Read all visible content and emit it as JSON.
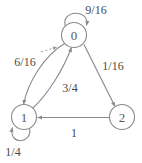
{
  "diagram": {
    "type": "state-transition-diagram",
    "title": "",
    "background_color": "#ffffff",
    "stroke_color": "#8a8a8a",
    "text_color": "#4a4a4a",
    "nodes": [
      {
        "id": "0",
        "label": "0",
        "cx": 74,
        "cy": 35,
        "r": 12.5
      },
      {
        "id": "1",
        "label": "1",
        "cx": 24,
        "cy": 117,
        "r": 12.5
      },
      {
        "id": "2",
        "label": "2",
        "cx": 122,
        "cy": 117,
        "r": 12.5
      }
    ],
    "edges": [
      {
        "id": "e0-0",
        "from": "0",
        "to": "0",
        "label": "9/16",
        "label_x": 96,
        "label_y": 10,
        "kind": "self-loop"
      },
      {
        "id": "e0-1",
        "from": "0",
        "to": "1",
        "label": "6/16",
        "label_x": 25,
        "label_y": 62,
        "kind": "curve"
      },
      {
        "id": "e1-0",
        "from": "1",
        "to": "0",
        "label": "3/4",
        "label_x": 70,
        "label_y": 88,
        "kind": "curve"
      },
      {
        "id": "e0-2",
        "from": "0",
        "to": "2",
        "label": "1/16",
        "label_x": 113,
        "label_y": 66,
        "kind": "straight"
      },
      {
        "id": "e2-1",
        "from": "2",
        "to": "1",
        "label": "1",
        "label_x": 74,
        "label_y": 133,
        "kind": "straight"
      },
      {
        "id": "e1-1",
        "from": "1",
        "to": "1",
        "label": "1/4",
        "label_x": 13,
        "label_y": 152,
        "kind": "self-loop"
      }
    ]
  }
}
